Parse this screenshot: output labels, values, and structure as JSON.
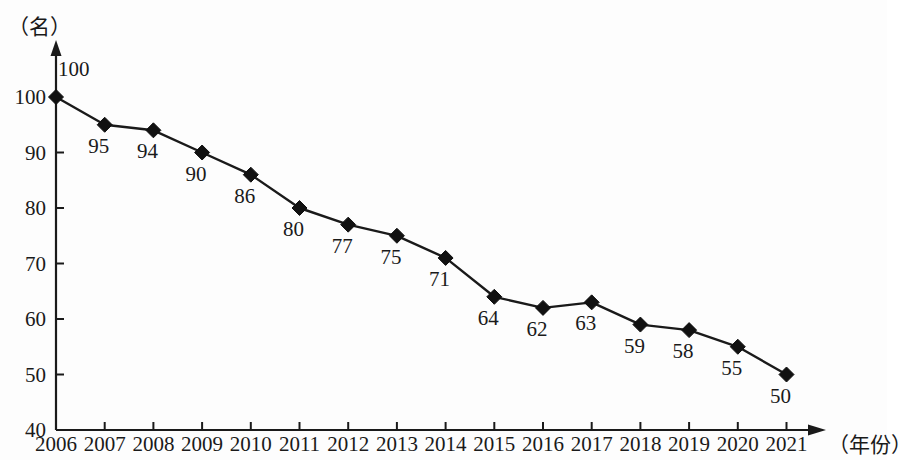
{
  "chart_data": {
    "type": "line",
    "title": "",
    "subtitle": "",
    "xlabel": "（年份）",
    "ylabel": "（名）",
    "categories": [
      "2006",
      "2007",
      "2008",
      "2009",
      "2010",
      "2011",
      "2012",
      "2013",
      "2014",
      "2015",
      "2016",
      "2017",
      "2018",
      "2019",
      "2020",
      "2021"
    ],
    "values": [
      100,
      95,
      94,
      90,
      86,
      80,
      77,
      75,
      71,
      64,
      62,
      63,
      59,
      58,
      55,
      50
    ],
    "point_labels": [
      "100",
      "95",
      "94",
      "90",
      "86",
      "80",
      "77",
      "75",
      "71",
      "64",
      "62",
      "63",
      "59",
      "58",
      "55",
      "50"
    ],
    "ylim": [
      40,
      100
    ],
    "y_ticks": [
      "40",
      "50",
      "60",
      "70",
      "80",
      "90",
      "100"
    ],
    "y_tick_values": [
      40,
      50,
      60,
      70,
      80,
      90,
      100
    ],
    "grid": false,
    "legend": false,
    "legend_position": "none",
    "marker": "diamond",
    "series": [
      {
        "name": "人数",
        "values": [
          100,
          95,
          94,
          90,
          86,
          80,
          77,
          75,
          71,
          64,
          62,
          63,
          59,
          58,
          55,
          50
        ]
      }
    ],
    "colors": {
      "line": "#1a1a1a",
      "marker": "#111111",
      "axis": "#1a1a1a",
      "background": "#ffffff",
      "text": "#1a1a1a"
    }
  }
}
